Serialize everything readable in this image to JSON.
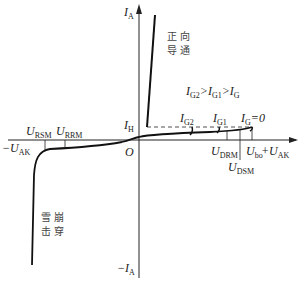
{
  "diagram": {
    "type": "thyristor_iv_characteristic",
    "axes": {
      "y_pos": {
        "var": "I",
        "sub": "A",
        "prefix": ""
      },
      "y_neg": {
        "var": "I",
        "sub": "A",
        "prefix": "−"
      },
      "x_pos": {
        "var": "U",
        "sub": "AK",
        "prefix": "+"
      },
      "x_neg": {
        "var": "U",
        "sub": "AK",
        "prefix": "−"
      },
      "origin": "O"
    },
    "labels": {
      "forward_conduction": [
        "正向",
        "导通"
      ],
      "avalanche_breakdown": [
        "雪崩",
        "击穿"
      ],
      "gate_relation": {
        "a": "I",
        "as": "G2",
        "b": "I",
        "bs": "G1",
        "c": "I",
        "cs": "G"
      },
      "ih": {
        "var": "I",
        "sub": "H"
      },
      "ig2": {
        "var": "I",
        "sub": "G2"
      },
      "ig1": {
        "var": "I",
        "sub": "G1"
      },
      "ig0": {
        "var": "I",
        "sub": "G",
        "suffix": "=0"
      },
      "udrm": {
        "var": "U",
        "sub": "DRM"
      },
      "udsm": {
        "var": "U",
        "sub": "DSM"
      },
      "ubo": {
        "var": "U",
        "sub": "bo"
      },
      "ursm": {
        "var": "U",
        "sub": "RSM"
      },
      "urrm": {
        "var": "U",
        "sub": "RRM"
      }
    },
    "colors": {
      "line": "#222222",
      "text": "#222222"
    }
  }
}
